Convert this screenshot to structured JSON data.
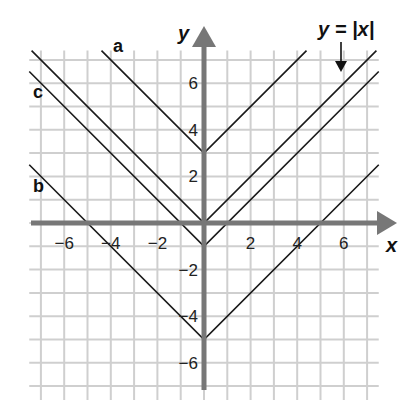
{
  "chart_data": {
    "type": "line",
    "title": "",
    "xlabel": "x",
    "ylabel": "y",
    "xlim": [
      -7.5,
      7.5
    ],
    "ylim": [
      -7.6,
      7.4
    ],
    "grid": true,
    "x_ticks": [
      "-6",
      "-4",
      "-2",
      "2",
      "4",
      "6"
    ],
    "y_ticks": [
      "6",
      "4",
      "2",
      "-2",
      "-4",
      "-6"
    ],
    "series": [
      {
        "name": "a",
        "equation": "y = |x| + 3",
        "vertex": [
          0,
          3
        ]
      },
      {
        "name": "y = |x|",
        "equation": "y = |x|",
        "vertex": [
          0,
          0
        ]
      },
      {
        "name": "c",
        "equation": "y = |x| - 1",
        "vertex": [
          0,
          -1
        ]
      },
      {
        "name": "b",
        "equation": "y = |x| - 5",
        "vertex": [
          0,
          -5
        ]
      }
    ],
    "annotations": [
      "a",
      "b",
      "c",
      "y = |x|"
    ]
  },
  "labels": {
    "x_axis": "x",
    "y_axis": "y",
    "parent_fn": "y = |x|",
    "a": "a",
    "b": "b",
    "c": "c"
  },
  "ticks": {
    "x": [
      "−6",
      "−4",
      "−2",
      "2",
      "4",
      "6"
    ],
    "y": [
      "6",
      "4",
      "2",
      "−2",
      "−4",
      "−6"
    ]
  }
}
